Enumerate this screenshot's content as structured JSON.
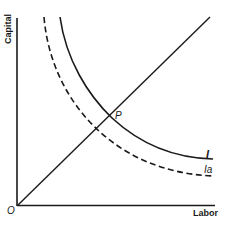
{
  "diagram": {
    "type": "isoquant",
    "axes": {
      "y_label": "Capital",
      "x_label": "Labor",
      "origin_label": "O"
    },
    "point": {
      "label": "P"
    },
    "curves": [
      {
        "id": "I",
        "label": "I",
        "style": "solid"
      },
      {
        "id": "Ia",
        "label": "Ia",
        "style": "dashed"
      }
    ],
    "ray": {
      "from": "O",
      "style": "solid"
    },
    "colors": {
      "line": "#1a1a1a",
      "background": "#ffffff"
    }
  }
}
